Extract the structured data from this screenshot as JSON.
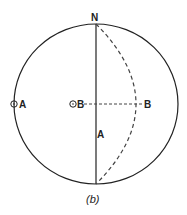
{
  "figure": {
    "caption": "(b)",
    "labels": {
      "north": "N",
      "pole_a": "A",
      "pole_b": "B",
      "point_b": "B",
      "line_a": "A"
    },
    "colors": {
      "stroke": "#222222",
      "background": "#ffffff"
    }
  }
}
